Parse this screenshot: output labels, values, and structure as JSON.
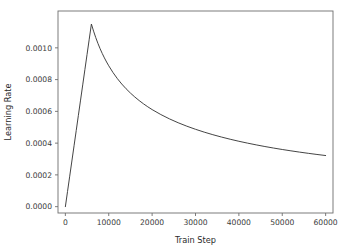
{
  "figure": {
    "background_color": "#ffffff",
    "axes_background_color": "#ffffff",
    "spine_color": "#6e6e6e",
    "tick_label_color": "#3b3b3b"
  },
  "chart_data": {
    "type": "line",
    "title": "",
    "subtitle": "",
    "xlabel": "Train Step",
    "ylabel": "Learning Rate",
    "xlim": [
      -1700,
      61700
    ],
    "ylim": [
      -4e-05,
      0.001232
    ],
    "grid": false,
    "legend": null,
    "legend_position": "none",
    "annotations": [],
    "line_color": "#3a3a3a",
    "line_width": 0.95,
    "xticks": [
      0,
      10000,
      20000,
      30000,
      40000,
      50000,
      60000
    ],
    "xtick_labels": [
      "0",
      "10000",
      "20000",
      "30000",
      "40000",
      "50000",
      "60000"
    ],
    "yticks": [
      0.0,
      0.0002,
      0.0004,
      0.0006,
      0.0008,
      0.001
    ],
    "ytick_labels": [
      "0.0000",
      "0.0002",
      "0.0004",
      "0.0006",
      "0.0008",
      "0.0010"
    ],
    "series": [
      {
        "name": "Learning Rate",
        "x": [
          0,
          500,
          1000,
          1500,
          2000,
          2500,
          3000,
          3500,
          4000,
          4500,
          5000,
          5500,
          6000,
          6500,
          7000,
          7500,
          8000,
          8500,
          9000,
          9500,
          10000,
          11000,
          12000,
          13000,
          14000,
          15000,
          16000,
          17000,
          18000,
          19000,
          20000,
          22000,
          24000,
          26000,
          28000,
          30000,
          32000,
          34000,
          36000,
          38000,
          40000,
          42000,
          44000,
          46000,
          48000,
          50000,
          52000,
          54000,
          56000,
          58000,
          60000
        ],
        "y": [
          0.0,
          9.58e-05,
          0.0001917,
          0.0002875,
          0.0003833,
          0.0004792,
          0.000575,
          0.0006708,
          0.0007667,
          0.0008625,
          0.0009583,
          0.0010542,
          0.00115,
          0.0011052,
          0.0010648,
          0.0010283,
          0.000995,
          0.0009646,
          0.0009367,
          0.0009108,
          0.0008869,
          0.0008437,
          0.0008058,
          0.0007722,
          0.0007422,
          0.0007152,
          0.0006907,
          0.0006683,
          0.0006477,
          0.0006287,
          0.0006112,
          0.00058,
          0.0005526,
          0.0005284,
          0.0005067,
          0.0004871,
          0.0004693,
          0.0004531,
          0.0004382,
          0.0004245,
          0.0004117,
          0.0003999,
          0.0003889,
          0.0003786,
          0.000369,
          0.0003599,
          0.0003514,
          0.0003434,
          0.0003358,
          0.0003286,
          0.0003218
        ]
      }
    ],
    "peak": {
      "x": 6000,
      "y": 0.00115
    },
    "start": {
      "x": 0,
      "y": 0.0
    },
    "end": {
      "x": 60000,
      "y": 0.00036
    }
  }
}
